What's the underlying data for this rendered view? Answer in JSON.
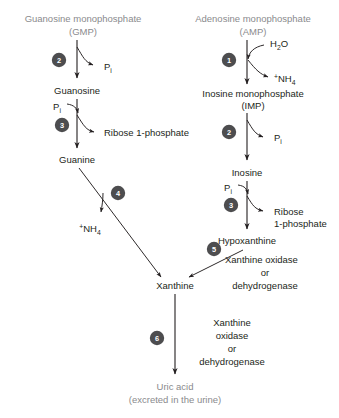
{
  "diagram": {
    "colors": {
      "ink": "#231f20",
      "muted_text": "#8a8a8d",
      "step_circle": "#4d4d4f",
      "step_number_text": "#ffffff",
      "background": "#ffffff"
    },
    "left_branch": {
      "header_line1": "Guanosine monophosphate",
      "header_line2": "(GMP)",
      "nodes": [
        {
          "id": "gmp",
          "label": "Guanosine monophosphate"
        },
        {
          "id": "guanosine",
          "label": "Guanosine"
        },
        {
          "id": "guanine",
          "label": "Guanine"
        }
      ],
      "steps": [
        {
          "number": "2",
          "output": "P",
          "output_sub": "i"
        },
        {
          "number": "3",
          "input": "P",
          "input_sub": "i",
          "output": "Ribose 1-phosphate"
        },
        {
          "number": "4",
          "output_sup": "+",
          "output": "NH",
          "output_sub": "4"
        }
      ]
    },
    "right_branch": {
      "header_line1": "Adenosine monophosphate",
      "header_line2": "(AMP)",
      "nodes": [
        {
          "id": "amp",
          "label": "Adenosine monophosphate"
        },
        {
          "id": "imp_line1",
          "label": "Inosine monophosphate"
        },
        {
          "id": "imp_line2",
          "label": "(IMP)"
        },
        {
          "id": "inosine",
          "label": "Inosine"
        },
        {
          "id": "hypoxanthine",
          "label": "Hypoxanthine"
        }
      ],
      "steps": [
        {
          "number": "1",
          "input": "H",
          "input_sub": "2",
          "input_tail": "O",
          "output_sup": "+",
          "output": "NH",
          "output_sub": "4"
        },
        {
          "number": "2",
          "output": "P",
          "output_sub": "i"
        },
        {
          "number": "3",
          "input": "P",
          "input_sub": "i",
          "output_line1": "Ribose",
          "output_line2": "1-phosphate"
        },
        {
          "number": "5",
          "enzyme_line1": "Xanthine oxidase",
          "enzyme_line2": "or",
          "enzyme_line3": "dehydrogenase"
        }
      ]
    },
    "convergence": {
      "node_label": "Xanthine"
    },
    "final_step": {
      "number": "6",
      "enzyme_line1": "Xanthine",
      "enzyme_line2": "oxidase",
      "enzyme_line3": "or",
      "enzyme_line4": "dehydrogenase"
    },
    "product": {
      "line1": "Uric acid",
      "line2": "(excreted in the urine)"
    }
  }
}
